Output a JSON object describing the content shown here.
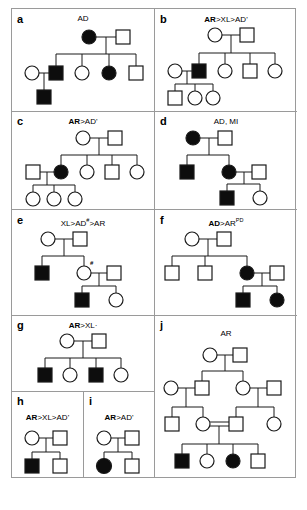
{
  "figure": {
    "caption": "",
    "panels": [
      {
        "id": "a",
        "label": "a",
        "title_html": "AD",
        "title_plain": "AD"
      },
      {
        "id": "b",
        "label": "b",
        "title_html": "<b>AR</b>>XL>AD'",
        "title_plain": "AR>XL>AD'"
      },
      {
        "id": "c",
        "label": "c",
        "title_html": "<b>AR</b>>AD'",
        "title_plain": "AR>AD'"
      },
      {
        "id": "d",
        "label": "d",
        "title_html": "AD, MI",
        "title_plain": "AD, MI"
      },
      {
        "id": "e",
        "label": "e",
        "title_html": "XL>AD<sup>#</sup>>AR",
        "title_plain": "XL>AD#>AR"
      },
      {
        "id": "f",
        "label": "f",
        "title_html": "<b>AD</b>>AR<sup>PD</sup>",
        "title_plain": "AD>AR(PD)"
      },
      {
        "id": "g",
        "label": "g",
        "title_html": "<b>AR</b>>XL·",
        "title_plain": "AR>XL"
      },
      {
        "id": "h",
        "label": "h",
        "title_html": "<b>AR</b>>XL>AD'",
        "title_plain": "AR>XL>AD'"
      },
      {
        "id": "i",
        "label": "i",
        "title_html": "<b>AR</b>>AD'",
        "title_plain": "AR>AD'"
      },
      {
        "id": "j",
        "label": "j",
        "title_html": "AR",
        "title_plain": "AR"
      }
    ],
    "legend": {
      "symbols": {
        "square": "male",
        "circle": "female",
        "filled": "affected",
        "open": "unaffected",
        "double-line": "consanguineous-union",
        "hash-marker": "#"
      }
    },
    "marker_hash": "#",
    "colors": {
      "affected_fill": "#0d0d0d",
      "unaffected_fill": "#ffffff",
      "stroke": "#1a1a1a",
      "panel_border": "#9a9a9a",
      "background": "#ffffff"
    },
    "pedigrees": {
      "a": {
        "generations": 3,
        "affected_count": 4,
        "individuals": 9
      },
      "b": {
        "generations": 3,
        "affected_count": 1,
        "individuals": 10
      },
      "c": {
        "generations": 3,
        "affected_count": 1,
        "individuals": 10
      },
      "d": {
        "generations": 3,
        "affected_count": 4,
        "individuals": 7
      },
      "e": {
        "generations": 3,
        "affected_count": 2,
        "individuals": 8
      },
      "f": {
        "generations": 3,
        "affected_count": 3,
        "individuals": 8
      },
      "g": {
        "generations": 2,
        "affected_count": 2,
        "individuals": 6
      },
      "h": {
        "generations": 2,
        "affected_count": 1,
        "individuals": 4
      },
      "i": {
        "generations": 2,
        "affected_count": 1,
        "individuals": 4
      },
      "j": {
        "generations": 4,
        "affected_count": 2,
        "individuals": 15
      }
    }
  }
}
